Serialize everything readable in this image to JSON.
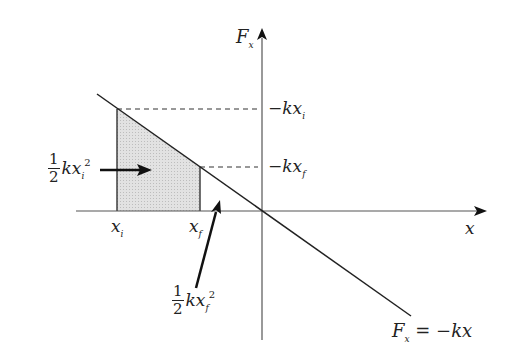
{
  "diagram": {
    "title": "",
    "axes": {
      "y_label": {
        "base": "F",
        "sub": "x"
      },
      "x_label": "x"
    },
    "function_label": {
      "lhs_base": "F",
      "lhs_sub": "x",
      "rhs": " = −kx"
    },
    "ticks": {
      "xi": {
        "base": "x",
        "sub": "i"
      },
      "xf": {
        "base": "x",
        "sub": "f"
      },
      "neg_kxi": {
        "base": "−kx",
        "sub": "i"
      },
      "neg_kxf": {
        "base": "−kx",
        "sub": "f"
      }
    },
    "annotations": {
      "area_i": {
        "num": "1",
        "den": "2",
        "base": "kx",
        "sub": "i",
        "sup": "2"
      },
      "area_f": {
        "num": "1",
        "den": "2",
        "base": "kx",
        "sub": "f",
        "sup": "2"
      }
    },
    "colors": {
      "line": "#222222",
      "shade": "#d9d9d9",
      "axis": "#555555"
    }
  }
}
